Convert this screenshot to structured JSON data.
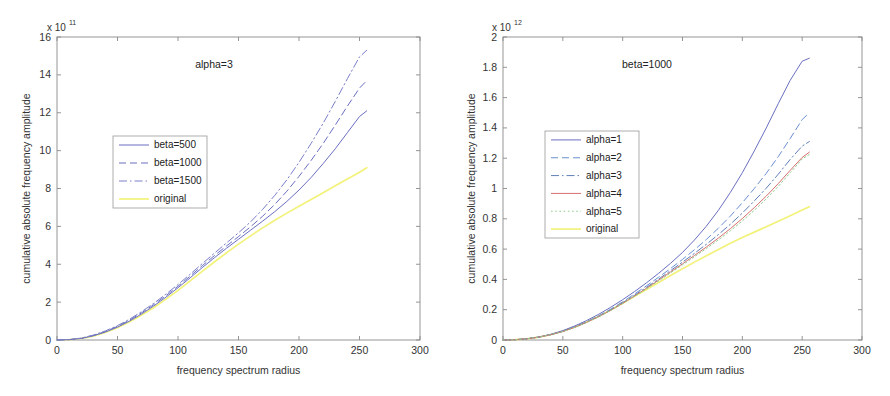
{
  "figure": {
    "background_color": "#ffffff",
    "panel_count": 2
  },
  "chart_data": [
    {
      "id": "left",
      "type": "line",
      "title": "",
      "annotation": "alpha=3",
      "xlabel": "frequency spectrum radius",
      "ylabel": "cumulative absolute frequency amplitude",
      "y_exponent_prefix": "x 10",
      "y_exponent": "11",
      "xlim": [
        0,
        300
      ],
      "ylim": [
        0,
        16
      ],
      "xticks": [
        0,
        50,
        100,
        150,
        200,
        250,
        300
      ],
      "xticklabels": [
        "0",
        "50",
        "100",
        "150",
        "200",
        "250",
        "300"
      ],
      "yticks": [
        0,
        2,
        4,
        6,
        8,
        10,
        12,
        14,
        16
      ],
      "yticklabels": [
        "0",
        "2",
        "4",
        "6",
        "8",
        "10",
        "12",
        "14",
        "16"
      ],
      "grid": false,
      "legend_position": "center-left",
      "x": [
        0,
        10,
        20,
        30,
        40,
        50,
        60,
        70,
        80,
        90,
        100,
        110,
        120,
        130,
        140,
        150,
        160,
        170,
        180,
        190,
        200,
        210,
        220,
        230,
        240,
        250,
        256
      ],
      "series": [
        {
          "name": "beta=500",
          "color": "#6a6fc0",
          "style": "solid",
          "values": [
            0,
            0.02,
            0.08,
            0.22,
            0.42,
            0.68,
            1.0,
            1.38,
            1.8,
            2.26,
            2.76,
            3.28,
            3.82,
            4.34,
            4.84,
            5.32,
            5.8,
            6.28,
            6.78,
            7.32,
            7.92,
            8.58,
            9.32,
            10.1,
            10.95,
            11.8,
            12.1
          ]
        },
        {
          "name": "beta=1000",
          "color": "#6a6fc0",
          "style": "dashed",
          "values": [
            0,
            0.02,
            0.09,
            0.24,
            0.45,
            0.72,
            1.05,
            1.44,
            1.87,
            2.34,
            2.84,
            3.37,
            3.92,
            4.45,
            4.96,
            5.46,
            5.98,
            6.54,
            7.16,
            7.86,
            8.64,
            9.48,
            10.38,
            11.35,
            12.35,
            13.3,
            13.7
          ]
        },
        {
          "name": "beta=1500",
          "color": "#7b7fc8",
          "style": "dashdot",
          "values": [
            0,
            0.02,
            0.1,
            0.26,
            0.48,
            0.76,
            1.1,
            1.5,
            1.94,
            2.42,
            2.93,
            3.47,
            4.03,
            4.58,
            5.12,
            5.66,
            6.24,
            6.9,
            7.64,
            8.46,
            9.38,
            10.38,
            11.45,
            12.6,
            13.8,
            14.95,
            15.3
          ]
        },
        {
          "name": "original",
          "color": "#f2f27a",
          "style": "solid",
          "values": [
            0,
            0.02,
            0.08,
            0.2,
            0.4,
            0.65,
            0.96,
            1.32,
            1.72,
            2.16,
            2.62,
            3.12,
            3.62,
            4.12,
            4.6,
            5.06,
            5.5,
            5.92,
            6.32,
            6.7,
            7.06,
            7.42,
            7.78,
            8.14,
            8.5,
            8.86,
            9.1
          ]
        }
      ]
    },
    {
      "id": "right",
      "type": "line",
      "title": "",
      "annotation": "beta=1000",
      "xlabel": "frequency spectrum radius",
      "ylabel": "cumulative absolute frequency amplitude",
      "y_exponent_prefix": "x 10",
      "y_exponent": "12",
      "xlim": [
        0,
        300
      ],
      "ylim": [
        0,
        2
      ],
      "xticks": [
        0,
        50,
        100,
        150,
        200,
        250,
        300
      ],
      "xticklabels": [
        "0",
        "50",
        "100",
        "150",
        "200",
        "250",
        "300"
      ],
      "yticks": [
        0,
        0.2,
        0.4,
        0.6,
        0.8,
        1,
        1.2,
        1.4,
        1.6,
        1.8,
        2
      ],
      "yticklabels": [
        "0",
        "0.2",
        "0.4",
        "0.6",
        "0.8",
        "1",
        "1.2",
        "1.4",
        "1.6",
        "1.8",
        "2"
      ],
      "grid": false,
      "legend_position": "center-left",
      "x": [
        0,
        10,
        20,
        30,
        40,
        50,
        60,
        70,
        80,
        90,
        100,
        110,
        120,
        130,
        140,
        150,
        160,
        170,
        180,
        190,
        200,
        210,
        220,
        230,
        240,
        250,
        256
      ],
      "series": [
        {
          "name": "alpha=1",
          "color": "#6a6fc0",
          "style": "solid",
          "values": [
            0,
            0.002,
            0.008,
            0.02,
            0.038,
            0.062,
            0.093,
            0.129,
            0.17,
            0.216,
            0.266,
            0.32,
            0.378,
            0.44,
            0.506,
            0.578,
            0.66,
            0.752,
            0.856,
            0.974,
            1.104,
            1.248,
            1.4,
            1.56,
            1.714,
            1.84,
            1.86
          ]
        },
        {
          "name": "alpha=2",
          "color": "#6a8fd0",
          "style": "dashed",
          "values": [
            0,
            0.002,
            0.008,
            0.019,
            0.036,
            0.058,
            0.087,
            0.121,
            0.16,
            0.204,
            0.252,
            0.304,
            0.358,
            0.414,
            0.472,
            0.532,
            0.596,
            0.664,
            0.738,
            0.818,
            0.906,
            1.0,
            1.1,
            1.21,
            1.33,
            1.455,
            1.5
          ]
        },
        {
          "name": "alpha=3",
          "color": "#5f7fb8",
          "style": "dashdot",
          "values": [
            0,
            0.002,
            0.008,
            0.019,
            0.035,
            0.057,
            0.085,
            0.118,
            0.156,
            0.199,
            0.246,
            0.296,
            0.348,
            0.402,
            0.458,
            0.514,
            0.572,
            0.632,
            0.696,
            0.764,
            0.838,
            0.918,
            1.002,
            1.094,
            1.192,
            1.28,
            1.31
          ]
        },
        {
          "name": "alpha=4",
          "color": "#d87070",
          "style": "solid",
          "values": [
            0,
            0.002,
            0.008,
            0.019,
            0.035,
            0.056,
            0.084,
            0.117,
            0.154,
            0.196,
            0.242,
            0.291,
            0.342,
            0.395,
            0.449,
            0.503,
            0.558,
            0.614,
            0.673,
            0.735,
            0.802,
            0.874,
            0.95,
            1.032,
            1.12,
            1.205,
            1.24
          ]
        },
        {
          "name": "alpha=5",
          "color": "#8fcf8f",
          "style": "dotted",
          "values": [
            0,
            0.002,
            0.008,
            0.019,
            0.035,
            0.056,
            0.083,
            0.116,
            0.153,
            0.195,
            0.24,
            0.288,
            0.338,
            0.39,
            0.443,
            0.496,
            0.55,
            0.604,
            0.661,
            0.721,
            0.786,
            0.856,
            0.932,
            1.014,
            1.104,
            1.195,
            1.225
          ]
        },
        {
          "name": "original",
          "color": "#f2f27a",
          "style": "solid",
          "values": [
            0,
            0.002,
            0.008,
            0.019,
            0.036,
            0.058,
            0.086,
            0.119,
            0.157,
            0.198,
            0.242,
            0.288,
            0.334,
            0.38,
            0.425,
            0.47,
            0.514,
            0.556,
            0.598,
            0.638,
            0.676,
            0.712,
            0.748,
            0.784,
            0.82,
            0.858,
            0.88
          ]
        }
      ]
    }
  ]
}
